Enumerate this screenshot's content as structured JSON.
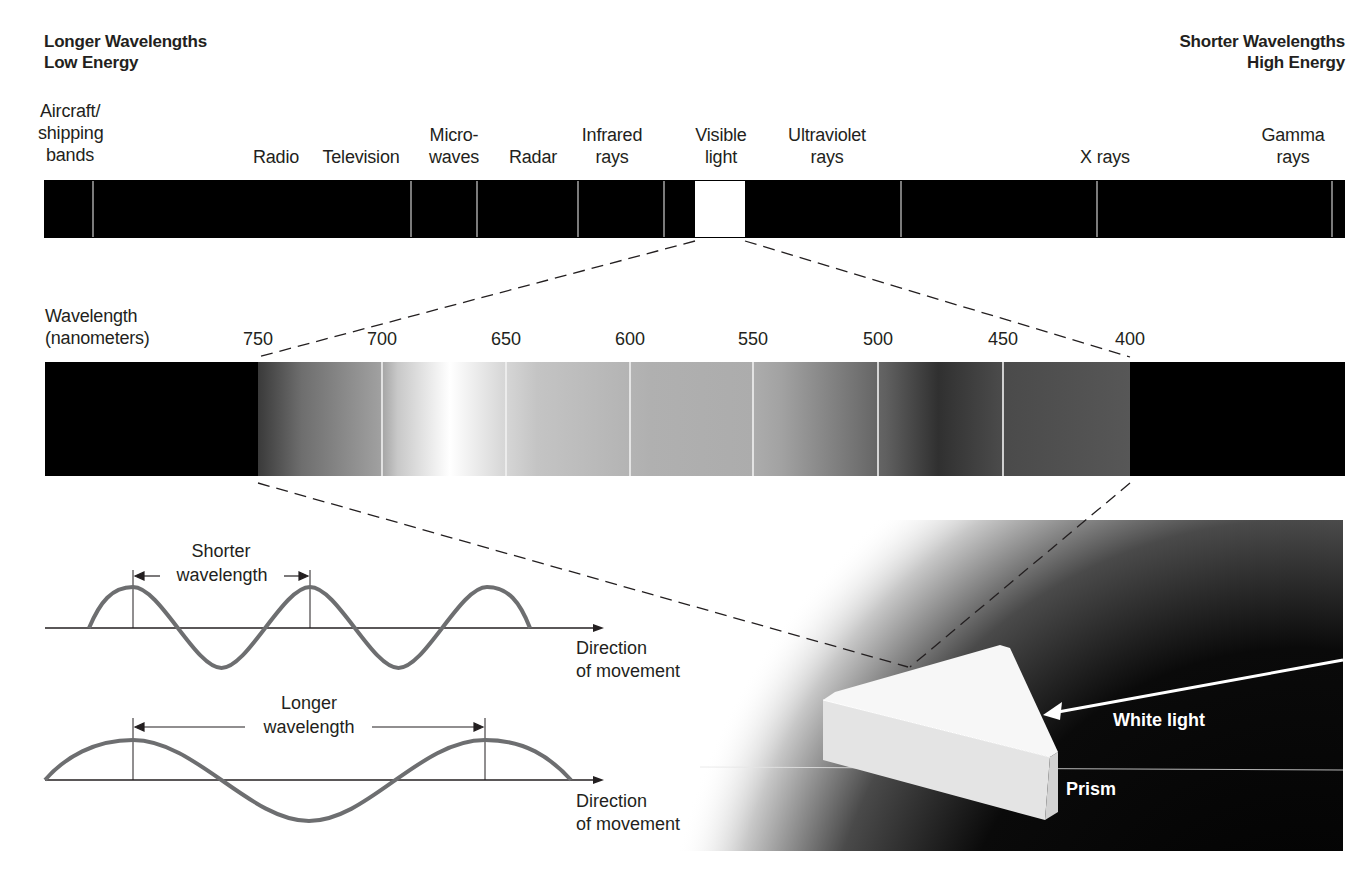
{
  "header": {
    "left": {
      "line1": "Longer Wavelengths",
      "line2": "Low Energy"
    },
    "right": {
      "line1": "Shorter Wavelengths",
      "line2": "High Energy"
    }
  },
  "spectrum": {
    "bands": [
      {
        "id": "aircraft",
        "lines": [
          "Aircraft/",
          "shipping",
          "bands"
        ]
      },
      {
        "id": "radio",
        "lines": [
          "Radio"
        ]
      },
      {
        "id": "television",
        "lines": [
          "Television"
        ]
      },
      {
        "id": "microwaves",
        "lines": [
          "Micro-",
          "waves"
        ]
      },
      {
        "id": "radar",
        "lines": [
          "Radar"
        ]
      },
      {
        "id": "infrared",
        "lines": [
          "Infrared",
          "rays"
        ]
      },
      {
        "id": "visible",
        "lines": [
          "Visible",
          "light"
        ]
      },
      {
        "id": "ultraviolet",
        "lines": [
          "Ultraviolet",
          "rays"
        ]
      },
      {
        "id": "xrays",
        "lines": [
          "X rays"
        ]
      },
      {
        "id": "gamma",
        "lines": [
          "Gamma",
          "rays"
        ]
      }
    ]
  },
  "visible_spectrum": {
    "axis_label": {
      "line1": "Wavelength",
      "line2": "(nanometers)"
    },
    "ticks": [
      "750",
      "700",
      "650",
      "600",
      "550",
      "500",
      "450",
      "400"
    ]
  },
  "waves": {
    "short": {
      "label_line1": "Shorter",
      "label_line2": "wavelength",
      "direction_line1": "Direction",
      "direction_line2": "of movement"
    },
    "long": {
      "label_line1": "Longer",
      "label_line2": "wavelength",
      "direction_line1": "Direction",
      "direction_line2": "of movement"
    }
  },
  "prism": {
    "white_light_label": "White light",
    "prism_label": "Prism"
  },
  "colors": {
    "bar": "#000000",
    "wave_stroke": "#6d6e70",
    "dash": "#231f20"
  }
}
